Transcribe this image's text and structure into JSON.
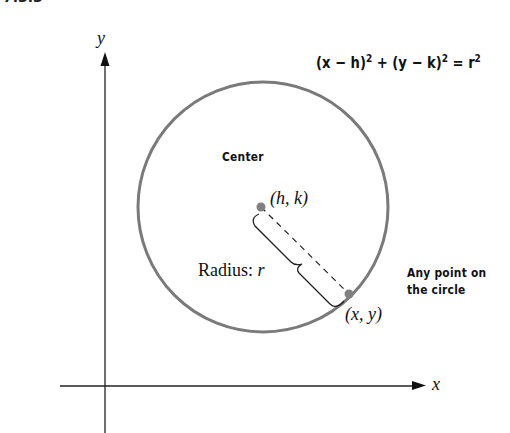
{
  "header_fragment": "7.3.3",
  "diagram": {
    "axes": {
      "x_label": "x",
      "y_label": "y"
    },
    "equation": {
      "left1": "(x − h)",
      "exp1": "2",
      "plus": " + ",
      "left2": "(y − k)",
      "exp2": "2",
      "equals": " = r",
      "exp3": "2"
    },
    "labels": {
      "center_title": "Center",
      "center_coords": "(h, k)",
      "radius": "Radius: r",
      "radius_prefix": "Radius: ",
      "radius_var": "r",
      "point_title_line1": "Any point on",
      "point_title_line2": "the circle",
      "point_coords": "(x, y)"
    },
    "colors": {
      "circle": "#7a7a7a",
      "axis": "#222222",
      "point": "#808080",
      "text": "#111111"
    }
  }
}
